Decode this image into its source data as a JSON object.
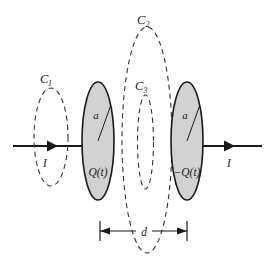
{
  "figure": {
    "background_color": "#ffffff",
    "plate_fill_color": "#d2d2d2",
    "stroke_color": "#1a1a1a",
    "dashed_stroke_color": "#333333"
  },
  "loops": {
    "c1": {
      "label": "C",
      "subscript": "1",
      "style": "dashed-ellipse"
    },
    "c2": {
      "label": "C",
      "subscript": "2",
      "style": "dashed-ellipse"
    },
    "c3": {
      "label": "C",
      "subscript": "3",
      "style": "dashed-ellipse"
    }
  },
  "plates": {
    "left": {
      "radius_label": "a",
      "charge_label": "Q(t)"
    },
    "right": {
      "radius_label": "a",
      "charge_label": "−Q(t)"
    }
  },
  "wires": {
    "left_current_label": "I",
    "right_current_label": "I"
  },
  "dimension": {
    "separation_label": "d"
  }
}
